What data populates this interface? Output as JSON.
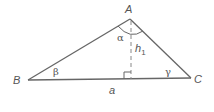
{
  "diagram": {
    "type": "triangle-with-altitude",
    "colors": {
      "stroke": "#666666",
      "text": "#555555",
      "background": "#ffffff"
    },
    "vertices": {
      "A": {
        "label": "A",
        "x": 130,
        "y": 19
      },
      "B": {
        "label": "B",
        "x": 28,
        "y": 80
      },
      "C": {
        "label": "C",
        "x": 191,
        "y": 78
      }
    },
    "altitude": {
      "label_main": "h",
      "label_sub": "1",
      "foot_x": 131,
      "foot_y": 79,
      "style": "dashed"
    },
    "angles": {
      "alpha": {
        "label": "α"
      },
      "beta": {
        "label": "β"
      },
      "gamma": {
        "label": "γ"
      }
    },
    "side": {
      "label": "a"
    },
    "right_angle_marker": true
  }
}
